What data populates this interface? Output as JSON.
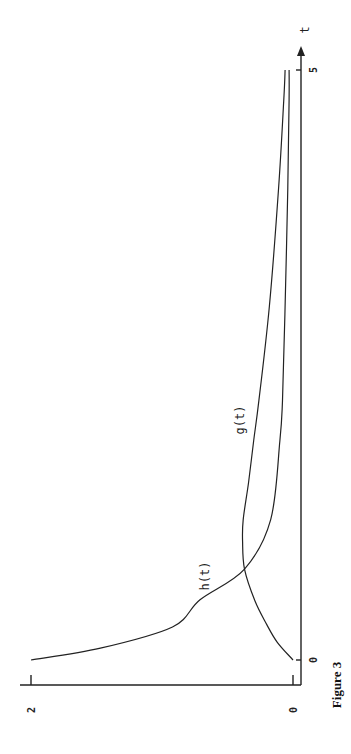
{
  "figure": {
    "caption": "Figure 3",
    "rotation": "chart rotated 90 degrees on page",
    "colors": {
      "ink": "#222222",
      "background": "#ffffff"
    }
  },
  "chart_data": {
    "type": "line",
    "title": "",
    "caption": "Figure 3",
    "xlabel": "t",
    "ylabel": "",
    "xlim": [
      0,
      5
    ],
    "ylim": [
      0,
      2
    ],
    "x_ticks": [
      "0",
      "5"
    ],
    "y_ticks": [
      "0",
      "2"
    ],
    "grid": false,
    "legend": "inline curve labels",
    "series": [
      {
        "name": "h(t)",
        "x": [
          0,
          0.1,
          0.28,
          0.51,
          0.77,
          1.19,
          1.86,
          2.2,
          3.0,
          4.0,
          4.75,
          5.0
        ],
        "values": [
          2.0,
          1.47,
          0.92,
          0.71,
          0.37,
          0.17,
          0.1,
          0.08,
          0.06,
          0.04,
          0.03,
          0.03
        ]
      },
      {
        "name": "g(t)",
        "x": [
          0,
          0.15,
          0.3,
          0.5,
          0.77,
          1.0,
          1.19,
          1.5,
          1.86,
          2.2,
          3.0,
          4.0,
          4.75,
          5.0
        ],
        "values": [
          0.0,
          0.12,
          0.2,
          0.29,
          0.37,
          0.385,
          0.38,
          0.34,
          0.3,
          0.26,
          0.18,
          0.11,
          0.07,
          0.06
        ]
      }
    ]
  },
  "labels": {
    "t_axis": "t",
    "t_tick_0": "0",
    "t_tick_5": "5",
    "v_tick_0": "0",
    "v_tick_2": "2",
    "h_label": "h(t)",
    "g_label": "g(t)"
  }
}
